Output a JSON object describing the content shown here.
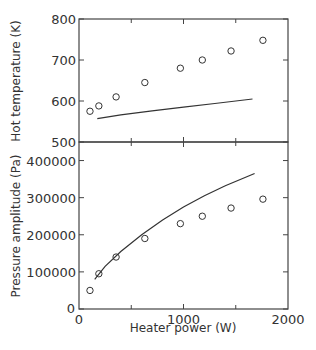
{
  "chart_data": [
    {
      "type": "scatter",
      "title": "",
      "xlabel": "Heater power (W)",
      "ylabel": "Hot temperature (K)",
      "xlim": [
        0,
        2000
      ],
      "ylim": [
        500,
        800
      ],
      "yticks": [
        "500",
        "600",
        "700",
        "800"
      ],
      "grid": false,
      "series": [
        {
          "name": "measured",
          "style": "open-circle",
          "x": [
            105,
            190,
            355,
            630,
            970,
            1180,
            1455,
            1760
          ],
          "y": [
            575,
            588,
            610,
            645,
            680,
            700,
            722,
            748
          ]
        },
        {
          "name": "model",
          "style": "line",
          "x": [
            175,
            400,
            700,
            1000,
            1300,
            1660
          ],
          "y": [
            557,
            566,
            576,
            585,
            594,
            605
          ]
        }
      ]
    },
    {
      "type": "scatter",
      "title": "",
      "xlabel": "Heater power (W)",
      "ylabel": "Pressure amplitude (Pa)",
      "xlim": [
        0,
        2000
      ],
      "ylim": [
        0,
        450000
      ],
      "xticks": [
        "0",
        "1000",
        "2000"
      ],
      "yticks": [
        "0",
        "100000",
        "200000",
        "300000",
        "400000"
      ],
      "grid": false,
      "series": [
        {
          "name": "measured",
          "style": "open-circle",
          "x": [
            105,
            190,
            355,
            630,
            970,
            1180,
            1455,
            1760
          ],
          "y": [
            50000,
            95000,
            140000,
            190000,
            230000,
            250000,
            272000,
            296000
          ]
        },
        {
          "name": "model",
          "style": "line",
          "x": [
            150,
            250,
            400,
            600,
            800,
            1000,
            1200,
            1400,
            1680
          ],
          "y": [
            80000,
            115000,
            155000,
            200000,
            240000,
            275000,
            305000,
            332000,
            365000
          ]
        }
      ]
    }
  ],
  "labels": {
    "xlabel": "Heater power (W)",
    "ylabel_top": "Hot temperature (K)",
    "ylabel_bottom": "Pressure amplitude (Pa)"
  }
}
